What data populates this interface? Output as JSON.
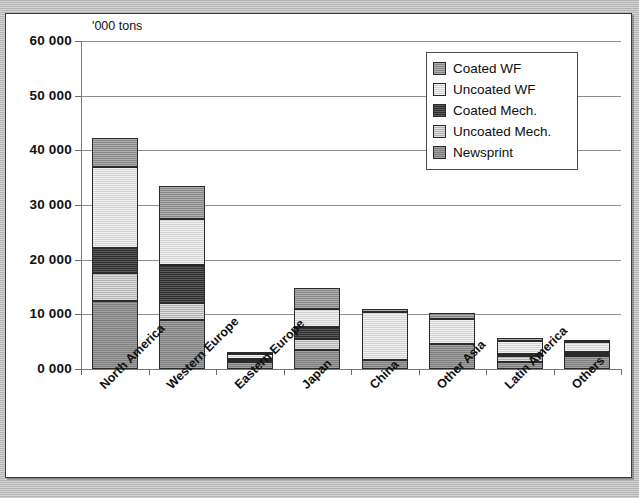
{
  "figure": {
    "units_note": "'000 tons",
    "background_color": "#ffffff",
    "frame_color": "#3a3a3a"
  },
  "legend": {
    "position": "inside-top-right",
    "entries": [
      {
        "label": "Coated WF",
        "key": "coated_wf",
        "color": "#9a9a9a"
      },
      {
        "label": "Uncoated WF",
        "key": "uncoated_wf",
        "color": "#e2e2e2"
      },
      {
        "label": "Coated Mech.",
        "key": "coated_mech",
        "color": "#3d3d3d"
      },
      {
        "label": "Uncoated Mech.",
        "key": "uncoated_mech",
        "color": "#c6c6c6"
      },
      {
        "label": "Newsprint",
        "key": "newsprint",
        "color": "#8d8d8d"
      }
    ]
  },
  "axes": {
    "y_ticks": [
      "0 000",
      "10 000",
      "20 000",
      "30 000",
      "40 000",
      "50 000",
      "60 000"
    ],
    "y_tick_values": [
      0,
      10000,
      20000,
      30000,
      40000,
      50000,
      60000
    ],
    "ylim": [
      0,
      60000
    ],
    "grid": true
  },
  "chart_data": {
    "type": "bar",
    "stacked": true,
    "title": "",
    "subtitle": "",
    "xlabel": "",
    "ylabel": "'000 tons",
    "ylim": [
      0,
      60000
    ],
    "ytick_labels": [
      "0 000",
      "10 000",
      "20 000",
      "30 000",
      "40 000",
      "50 000",
      "60 000"
    ],
    "grid": true,
    "legend_position": "inside-top-right",
    "categories": [
      "North America",
      "Western Europe",
      "Eastern Europe",
      "Japan",
      "China",
      "Other Asia",
      "Latin America",
      "Others"
    ],
    "series": [
      {
        "name": "Newsprint",
        "color": "#8d8d8d",
        "values": [
          12400,
          9000,
          1200,
          3400,
          1700,
          4500,
          1300,
          2400
        ]
      },
      {
        "name": "Uncoated Mech.",
        "color": "#c6c6c6",
        "values": [
          5100,
          3000,
          300,
          2000,
          0,
          0,
          1100,
          300
        ]
      },
      {
        "name": "Coated Mech.",
        "color": "#3d3d3d",
        "values": [
          4700,
          7100,
          400,
          2200,
          0,
          0,
          300,
          400
        ]
      },
      {
        "name": "Uncoated WF",
        "color": "#e2e2e2",
        "values": [
          14800,
          8400,
          900,
          3300,
          8700,
          4700,
          2500,
          1900
        ]
      },
      {
        "name": "Coated WF",
        "color": "#9a9a9a",
        "values": [
          5200,
          6000,
          400,
          4000,
          600,
          1000,
          500,
          300
        ]
      }
    ],
    "totals": [
      42200,
      33500,
      3200,
      14900,
      11000,
      10200,
      5700,
      5300
    ]
  }
}
